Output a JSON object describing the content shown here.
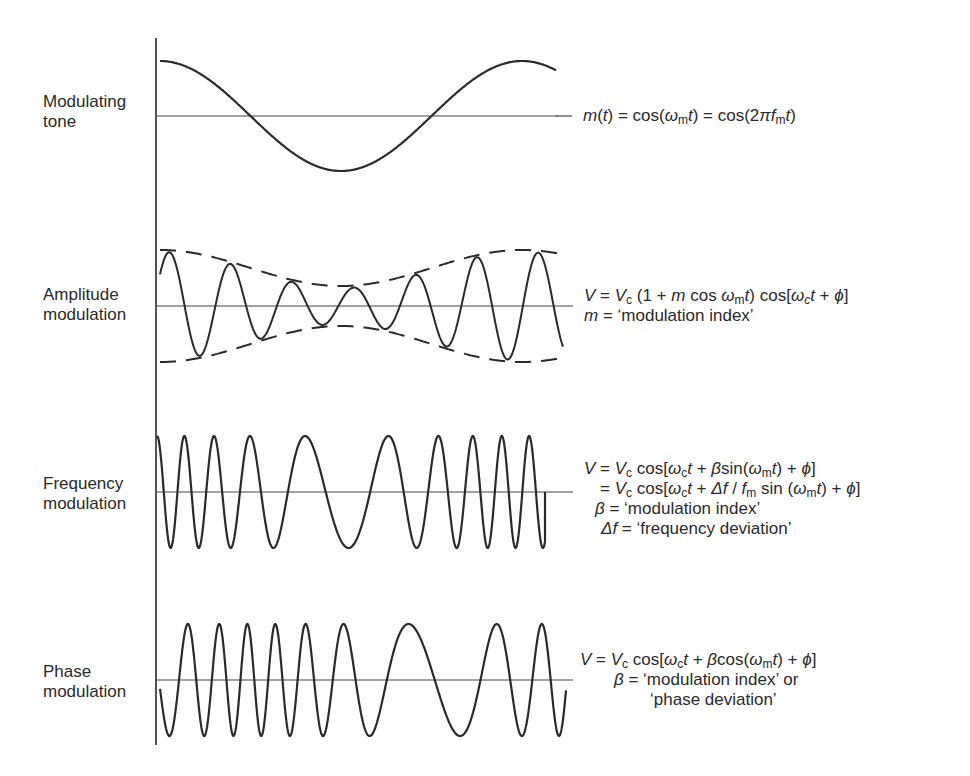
{
  "diagram": {
    "title": "",
    "axis": {
      "x": 156,
      "y_top": 38,
      "y_bottom": 745
    },
    "panels": [
      {
        "id": "modulating-tone",
        "label_line1": "Modulating",
        "label_line2": "tone",
        "baseline_y": 116,
        "equation_lines": [
          "m(t) = cos(ω_m t) = cos(2πf_m t)"
        ]
      },
      {
        "id": "amplitude-modulation",
        "label_line1": "Amplitude",
        "label_line2": "modulation",
        "baseline_y": 306,
        "equation_lines": [
          "V = V_c (1 + m cos ω_m t) cos[ω_c t + ϕ]",
          "m = 'modulation index'"
        ]
      },
      {
        "id": "frequency-modulation",
        "label_line1": "Frequency",
        "label_line2": "modulation",
        "baseline_y": 492,
        "equation_lines": [
          "V = V_c cos[ω_c t + β sin(ω_m t) + ϕ]",
          "= V_c cos[ω_c t + Δf / f_m sin(ω_m t) + ϕ]",
          "β = 'modulation index'",
          "Δf = 'frequency deviation'"
        ]
      },
      {
        "id": "phase-modulation",
        "label_line1": "Phase",
        "label_line2": "modulation",
        "baseline_y": 680,
        "equation_lines": [
          "V = V_c cos[ω_c t + β cos(ω_m t) + ϕ]",
          "β = 'modulation index' or",
          "'phase deviation'"
        ]
      }
    ],
    "text": {
      "tone_eq": {
        "m": "m",
        "t": "t",
        "eq1": ") = cos(",
        "omega": "ω",
        "sub_m": "m",
        "eq2": ") = cos(2",
        "pi": "π",
        "f": "f",
        "close": ")"
      },
      "am_eq1": {
        "V": "V",
        "eq": " = ",
        "Vc": "V",
        "c": "c",
        "part1": " (1 + ",
        "m": "m",
        "part2": " cos ",
        "omega": "ω",
        "sub_m": "m",
        "t": "t",
        "part3": ") cos[",
        "omega_c": "ω",
        "sub_c": "c",
        "t2": "t",
        "part4": " + ",
        "phi": "ϕ",
        "close": "]"
      },
      "am_eq2": {
        "m": "m",
        "rest": " = ‘modulation index’"
      },
      "fm_eq1": {
        "V": "V",
        "eq": " = ",
        "Vc": "V",
        "c": "c",
        "p1": " cos[",
        "omega": "ω",
        "sub_c": "c",
        "t": "t",
        "p2": " + ",
        "beta": "β",
        "p3": "sin(",
        "omega_m": "ω",
        "sub_m": "m",
        "t2": "t",
        "p4": ") + ",
        "phi": "ϕ",
        "close": "]"
      },
      "fm_eq2": {
        "eq": "= ",
        "Vc": "V",
        "c": "c",
        "p1": " cos[",
        "omega": "ω",
        "sub_c": "c",
        "t": "t",
        "p2": " + ",
        "delta_f": "Δf",
        "slash": " / ",
        "f": "f",
        "sub_m": "m",
        "p3": " sin (",
        "omega_m": "ω",
        "sub_m2": "m",
        "t2": "t",
        "p4": ") + ",
        "phi": "ϕ",
        "close": "]"
      },
      "fm_eq3": {
        "beta": "β",
        "rest": " = ‘modulation index’"
      },
      "fm_eq4": {
        "delta_f": "Δf",
        "rest": " = ‘frequency deviation’"
      },
      "pm_eq1": {
        "V": "V",
        "eq": " = ",
        "Vc": "V",
        "c": "c",
        "p1": " cos[",
        "omega": "ω",
        "sub_c": "c",
        "t": "t",
        "p2": " + ",
        "beta": "β",
        "p3": "cos(",
        "omega_m": "ω",
        "sub_m": "m",
        "t2": "t",
        "p4": ") + ",
        "phi": "ϕ",
        "close": "]"
      },
      "pm_eq2": {
        "beta": "β",
        "rest": " = ‘modulation index’ or"
      },
      "pm_eq3": {
        "rest": "‘phase deviation’"
      }
    },
    "colors": {
      "stroke": "#2a2a2a",
      "background": "#ffffff"
    }
  }
}
